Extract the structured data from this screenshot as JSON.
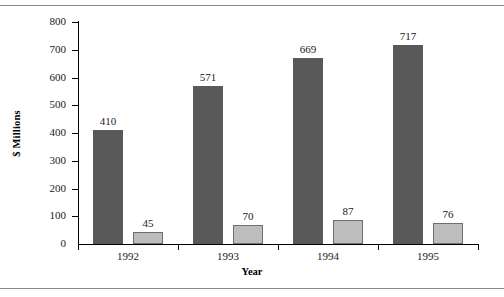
{
  "figure": {
    "frame": {
      "top_rule": true,
      "bottom_rule": true,
      "rule_color": "#8a8a8a"
    }
  },
  "chart_data": {
    "type": "bar",
    "title": "",
    "xlabel": "Year",
    "ylabel": "$ Millions",
    "categories": [
      "1992",
      "1993",
      "1994",
      "1995"
    ],
    "series": [
      {
        "name": "series-1",
        "color": "#595959",
        "values": [
          410,
          571,
          669,
          717
        ]
      },
      {
        "name": "series-2",
        "color": "#bdbdbd",
        "values": [
          45,
          70,
          87,
          76
        ]
      }
    ],
    "ylim": [
      0,
      800
    ],
    "yticks": [
      0,
      100,
      200,
      300,
      400,
      500,
      600,
      700,
      800
    ],
    "ytick_labels": [
      "0",
      "100",
      "200",
      "300",
      "400",
      "500",
      "600",
      "700",
      "800"
    ],
    "grid": false,
    "legend": "none",
    "data_labels": true,
    "data_labels_values": [
      "410",
      "45",
      "571",
      "70",
      "669",
      "87",
      "717",
      "76"
    ]
  }
}
